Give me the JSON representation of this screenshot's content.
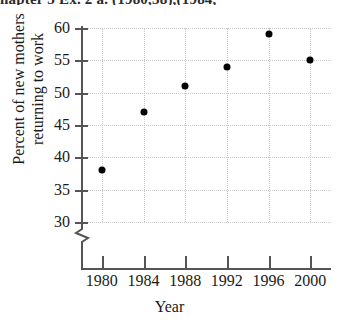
{
  "page_bleed": {
    "text": "hapter 3  Ex. 2  a.  (1980,38),(1984,"
  },
  "chart_data": {
    "type": "scatter",
    "title": "",
    "xlabel": "Year",
    "ylabel": "Percent of new mothers returning to work",
    "ylabel_line1": "Percent of new mothers",
    "ylabel_line2": "returning to work",
    "x": [
      1980,
      1984,
      1988,
      1992,
      1996,
      2000
    ],
    "values": [
      38,
      47,
      51,
      54,
      59,
      55
    ],
    "categories": [
      "1980",
      "1984",
      "1988",
      "1992",
      "1996",
      "2000"
    ],
    "xtick_labels": [
      "1980",
      "1984",
      "1988",
      "1992",
      "1996",
      "2000"
    ],
    "ytick_labels": [
      "30",
      "35",
      "40",
      "45",
      "50",
      "55",
      "60"
    ],
    "yticks": [
      30,
      35,
      40,
      45,
      50,
      55,
      60
    ],
    "xlim": [
      1978,
      2002
    ],
    "ylim": [
      30,
      60
    ],
    "y_axis_break": true,
    "grid": true,
    "legend": false,
    "marker": "filled-circle",
    "marker_color": "#000000",
    "grid_color": "#c9c9c9",
    "axis_color": "#555555"
  }
}
